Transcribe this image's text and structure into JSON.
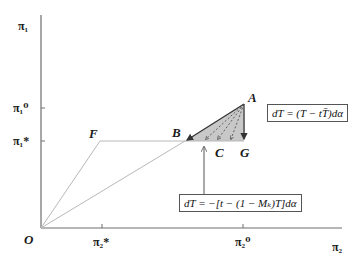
{
  "figure": {
    "axes": {
      "y_label": "π₁",
      "x_label": "π₂",
      "origin_label": "O",
      "y_ticks": [
        {
          "label": "π₁⁰",
          "name": "pi1-zero"
        },
        {
          "label": "π₁*",
          "name": "pi1-star"
        }
      ],
      "x_ticks": [
        {
          "label": "π₂*",
          "name": "pi2-star"
        },
        {
          "label": "π₂⁰",
          "name": "pi2-zero"
        }
      ]
    },
    "points": {
      "A": "A",
      "B": "B",
      "C": "C",
      "F": "F",
      "G": "G"
    },
    "equations": {
      "upper": "dT = (T − tT̄)dα",
      "lower": "dT = −[t − (1 − Mₖ)T]dα"
    },
    "colors": {
      "axis": "#6e6e6e",
      "thin_line": "#b8b8b8",
      "shade": "#c8c8c8",
      "arrow": "#333333"
    }
  }
}
